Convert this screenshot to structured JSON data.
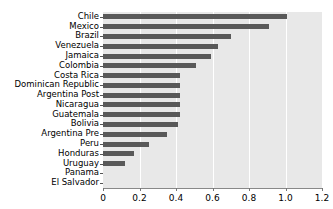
{
  "chart_data": {
    "type": "bar",
    "orientation": "horizontal",
    "title": "",
    "subtitle": "",
    "xlabel": "",
    "ylabel": "",
    "xlim": [
      0,
      1.2
    ],
    "xticks": [
      0,
      0.2,
      0.4,
      0.6,
      0.8,
      1.0,
      1.2
    ],
    "xticklabels": [
      "0",
      "0.2",
      "0.4",
      "0.6",
      "0.8",
      "1.0",
      "1.2"
    ],
    "grid": "vertical-white-gridlines",
    "legend": "none",
    "categories": [
      "Chile",
      "Mexico",
      "Brazil",
      "Venezuela",
      "Jamaica",
      "Colombia",
      "Costa Rica",
      "Dominican Republic",
      "Argentina Post",
      "Nicaragua",
      "Guatemala",
      "Bolivia",
      "Argentina Pre",
      "Peru",
      "Honduras",
      "Uruguay",
      "Panama",
      "El Salvador"
    ],
    "values": [
      1.01,
      0.91,
      0.7,
      0.63,
      0.59,
      0.51,
      0.42,
      0.42,
      0.42,
      0.42,
      0.42,
      0.41,
      0.35,
      0.25,
      0.17,
      0.12,
      0.0,
      0.0
    ],
    "bar_color": "#595959",
    "plot_background": "#e8e8e8",
    "gridline_color": "#ffffff",
    "figure_background": "#ffffff"
  }
}
